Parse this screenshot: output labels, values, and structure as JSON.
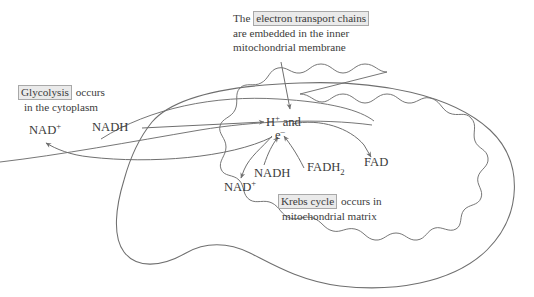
{
  "diagram": {
    "background_color": "#ffffff",
    "stroke_color": "#6f6f6f",
    "text_color": "#3b3b3b",
    "term_highlight_fill": "#eaeaea",
    "term_highlight_border": "#a8a8a8"
  },
  "annotations": {
    "etc": {
      "line1_pre": "The",
      "line1_term": "electron transport chains",
      "line2": "are embedded in the inner",
      "line3": "mitochondrial membrane"
    },
    "glycolysis": {
      "line1_term": "Glycolysis",
      "line1_post": "occurs",
      "line2": "in the cytoplasm"
    },
    "krebs": {
      "line1_term": "Krebs cycle",
      "line1_post": "occurs in",
      "line2": "mitochondrial matrix"
    }
  },
  "molecules": {
    "nad_plus_left": {
      "base": "NAD",
      "sup": "+"
    },
    "nadh_left": {
      "base": "NADH"
    },
    "h_and_e": {
      "h_base": "H",
      "h_sup": "+",
      "conj": "and",
      "e_base": "e",
      "e_sup": "–"
    },
    "nad_plus_inner": {
      "base": "NAD",
      "sup": "+"
    },
    "nadh_inner": {
      "base": "NADH"
    },
    "fadh2": {
      "base": "FADH",
      "sub": "2"
    },
    "fad": {
      "base": "FAD"
    }
  },
  "icons": {
    "arrow_etc_to_membrane": "down-arrow-icon",
    "arrow_nadh_to_h": "right-arrow-icon",
    "arrow_h_to_nad_left": "curved-left-arrow-icon",
    "arrow_e_to_nad_inner": "curved-down-arrow-icon",
    "arrow_nadh_inner_to_e": "curved-up-arrow-icon",
    "arrow_fadh2_to_e": "curved-up-arrow-icon",
    "arrow_e_to_fad": "curved-down-arrow-icon",
    "outer_membrane": "mitochondrion-outer-membrane-shape",
    "inner_membrane": "mitochondrion-cristae-shape"
  }
}
